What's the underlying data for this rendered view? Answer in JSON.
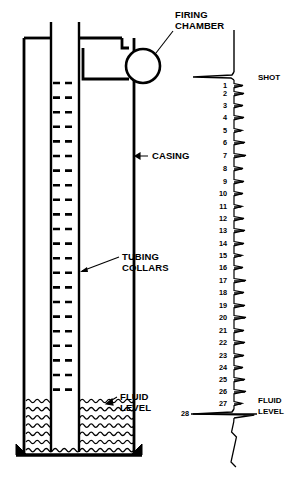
{
  "figure": {
    "background_color": "#ffffff",
    "ink_color": "#000000",
    "width": 307,
    "height": 485
  },
  "labels": {
    "firing_chamber_line1": "FIRING",
    "firing_chamber_line2": "CHAMBER",
    "casing": "CASING",
    "tubing_collars_line1": "TUBING",
    "tubing_collars_line2": "COLLARS",
    "fluid_level_line1": "FLUID",
    "fluid_level_line2": "LEVEL",
    "shot": "SHOT",
    "chart_fluid_level_line1": "FLUID",
    "chart_fluid_level_line2": "LEVEL"
  },
  "well": {
    "casing_left_x": 24,
    "casing_right_x": 134,
    "casing_top_y": 38,
    "casing_bottom_y": 455,
    "tubing_left_x": 51,
    "tubing_right_x": 79,
    "tubing_top_y": 22,
    "tubing_bottom_y": 452,
    "fluid_level_y": 401,
    "collar_count": 22,
    "collar_first_y": 83,
    "collar_spacing": 14.6,
    "collar_dash_pattern": "7,5"
  },
  "firing_chamber": {
    "circle_center_x": 143,
    "circle_center_y": 66,
    "circle_radius": 17
  },
  "chart_data": {
    "type": "line",
    "orientation": "vertical",
    "xlabel": "",
    "ylabel": "Collar count (joints of tubing)",
    "baseline_x": 233,
    "trace_top_y": 30,
    "trace_bottom_y": 472,
    "grid": false,
    "legend": false,
    "annotations": [
      {
        "name": "shot",
        "label": "SHOT",
        "y": 76,
        "kind": "initial-pulse"
      },
      {
        "name": "fluid-level",
        "label": "FLUID LEVEL",
        "y": 414,
        "kind": "liquid-level-reflection"
      }
    ],
    "categories": [
      1,
      2,
      3,
      4,
      5,
      6,
      7,
      8,
      9,
      10,
      11,
      12,
      13,
      14,
      15,
      16,
      17,
      18,
      19,
      20,
      21,
      22,
      23,
      24,
      25,
      26,
      27,
      28
    ],
    "series": [
      {
        "name": "collar reflections",
        "unit": "tubing joint",
        "points": [
          {
            "n": 1,
            "y": 86,
            "amp": 10
          },
          {
            "n": 2,
            "y": 94,
            "amp": 11
          },
          {
            "n": 3,
            "y": 106,
            "amp": 10
          },
          {
            "n": 4,
            "y": 118,
            "amp": 11
          },
          {
            "n": 5,
            "y": 131,
            "amp": 9
          },
          {
            "n": 6,
            "y": 143,
            "amp": 12
          },
          {
            "n": 7,
            "y": 156,
            "amp": 13
          },
          {
            "n": 8,
            "y": 169,
            "amp": 10
          },
          {
            "n": 9,
            "y": 182,
            "amp": 11
          },
          {
            "n": 10,
            "y": 194,
            "amp": 10
          },
          {
            "n": 11,
            "y": 207,
            "amp": 9
          },
          {
            "n": 12,
            "y": 219,
            "amp": 11
          },
          {
            "n": 13,
            "y": 231,
            "amp": 12
          },
          {
            "n": 14,
            "y": 244,
            "amp": 11
          },
          {
            "n": 15,
            "y": 256,
            "amp": 9
          },
          {
            "n": 16,
            "y": 268,
            "amp": 10
          },
          {
            "n": 17,
            "y": 281,
            "amp": 13
          },
          {
            "n": 18,
            "y": 293,
            "amp": 11
          },
          {
            "n": 19,
            "y": 306,
            "amp": 12
          },
          {
            "n": 20,
            "y": 318,
            "amp": 13
          },
          {
            "n": 21,
            "y": 331,
            "amp": 11
          },
          {
            "n": 22,
            "y": 343,
            "amp": 12
          },
          {
            "n": 23,
            "y": 356,
            "amp": 11
          },
          {
            "n": 24,
            "y": 368,
            "amp": 10
          },
          {
            "n": 25,
            "y": 380,
            "amp": 12
          },
          {
            "n": 26,
            "y": 392,
            "amp": 13
          },
          {
            "n": 27,
            "y": 404,
            "amp": 9
          },
          {
            "n": 28,
            "y": 414,
            "amp": 56
          }
        ]
      }
    ]
  }
}
